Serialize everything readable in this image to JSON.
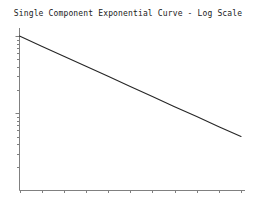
{
  "chart_data": {
    "type": "line",
    "title": "Single Component Exponential Curve - Log Scale",
    "xlabel": "",
    "ylabel": "",
    "yscale": "log",
    "xscale": "linear",
    "grid": false,
    "legend": null,
    "series": [
      {
        "name": "single exponential decay",
        "color": "#262626",
        "x": [
          0,
          10,
          20,
          30,
          40,
          50,
          60,
          70,
          80,
          90,
          100
        ],
        "y": [
          1000,
          741,
          549,
          407,
          301,
          223,
          165,
          122,
          91,
          67,
          50
        ]
      }
    ],
    "x": [
      0,
      10,
      20,
      30,
      40,
      50,
      60,
      70,
      80,
      90,
      100
    ],
    "xlim": [
      0,
      100
    ],
    "ylim": [
      10,
      1200
    ],
    "xticklabels": [
      "",
      "",
      "",
      "",
      "",
      "",
      "",
      "",
      "",
      "",
      ""
    ],
    "yticklabels": [],
    "x_major_tick_count": 11,
    "y_minor_tick_count": 21,
    "annotations": []
  },
  "figure": {
    "background_color": "#ffffff",
    "axis_color": "#808080",
    "title_color": "#1a1a1a",
    "line_color": "#262626"
  }
}
